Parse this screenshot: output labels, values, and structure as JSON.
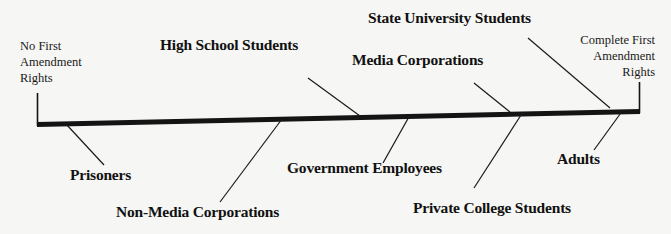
{
  "diagram": {
    "type": "continuum",
    "axis": {
      "left_label": [
        "No First",
        "Amendment",
        "Rights"
      ],
      "right_label": [
        "Complete First",
        "Amendment",
        "Rights"
      ],
      "start": {
        "x": 37,
        "y": 125
      },
      "end": {
        "x": 640,
        "y": 112
      }
    },
    "items": [
      {
        "label": "Prisoners",
        "position": "below",
        "anchor": {
          "x": 66,
          "y": 124
        },
        "tip": {
          "x": 104,
          "y": 165
        },
        "text_pos": {
          "x": 68,
          "y": 166
        }
      },
      {
        "label": "Non-Media Corporations",
        "position": "below",
        "anchor": {
          "x": 282,
          "y": 119
        },
        "tip": {
          "x": 220,
          "y": 202
        },
        "text_pos": {
          "x": 116,
          "y": 202
        }
      },
      {
        "label": "High School Students",
        "position": "above",
        "anchor": {
          "x": 360,
          "y": 116
        },
        "tip": {
          "x": 308,
          "y": 78
        },
        "text_pos": {
          "x": 160,
          "y": 35
        }
      },
      {
        "label": "Government Employees",
        "position": "below",
        "anchor": {
          "x": 410,
          "y": 115
        },
        "tip": {
          "x": 383,
          "y": 163
        },
        "text_pos": {
          "x": 287,
          "y": 158
        }
      },
      {
        "label": "Media Corporations",
        "position": "above",
        "anchor": {
          "x": 510,
          "y": 112
        },
        "tip": {
          "x": 474,
          "y": 83
        },
        "text_pos": {
          "x": 352,
          "y": 50
        }
      },
      {
        "label": "Private College Students",
        "position": "below",
        "anchor": {
          "x": 523,
          "y": 112
        },
        "tip": {
          "x": 474,
          "y": 188
        },
        "text_pos": {
          "x": 413,
          "y": 198
        }
      },
      {
        "label": "State University Students",
        "position": "above",
        "anchor": {
          "x": 610,
          "y": 108
        },
        "tip": {
          "x": 528,
          "y": 38
        },
        "text_pos": {
          "x": 368,
          "y": 8
        }
      },
      {
        "label": "Adults",
        "position": "below",
        "anchor": {
          "x": 623,
          "y": 110
        },
        "tip": {
          "x": 594,
          "y": 150
        },
        "text_pos": {
          "x": 556,
          "y": 149
        }
      }
    ],
    "colors": {
      "background": "#f6f6f4",
      "line": "#141414",
      "text": "#111111"
    }
  }
}
